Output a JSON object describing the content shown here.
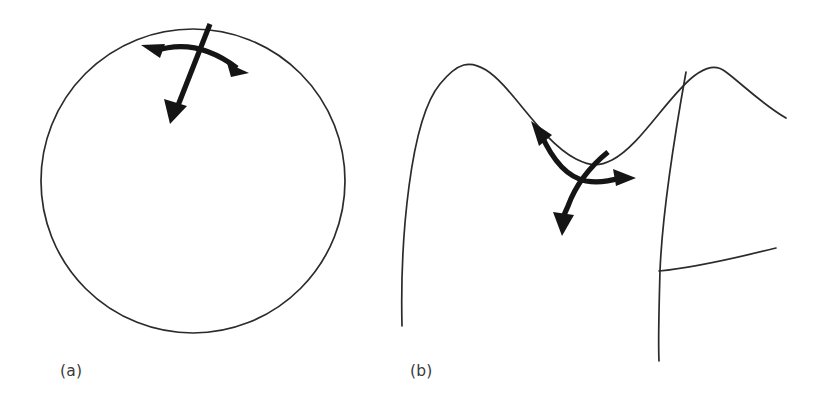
{
  "figure": {
    "title": "",
    "background_color": "#ffffff",
    "width": 827,
    "height": 415,
    "curve_color": "#2b2b2b",
    "arrow_color": "#151515",
    "label_color": "#3a3a3a"
  },
  "panels": [
    {
      "id": "a",
      "label": "(a)",
      "label_position": {
        "x": 60,
        "y": 362
      },
      "description": "circle-with-tangent-and-normal-arrows",
      "shapes": {
        "circle": {
          "cx": 193,
          "cy": 181,
          "r": 152
        },
        "tangent_double_arrow": {
          "type": "double-headed",
          "head_1": {
            "x": 143,
            "y": 46
          },
          "head_2": {
            "x": 247,
            "y": 72
          },
          "control": {
            "x": 196,
            "y": 38
          }
        },
        "normal_arrow": {
          "type": "single-headed",
          "tail": {
            "x": 210,
            "y": 24
          },
          "head": {
            "x": 170,
            "y": 122
          }
        }
      }
    },
    {
      "id": "b",
      "label": "(b)",
      "label_position": {
        "x": 410,
        "y": 362
      },
      "description": "wavy-surface-with-tangent-and-normal-arrows",
      "shapes": {
        "wave_curve": {
          "left_tail": {
            "x": 402,
            "y": 326
          },
          "peak_1": {
            "x": 476,
            "y": 62
          },
          "valley": {
            "x": 606,
            "y": 164
          },
          "peak_2": {
            "x": 720,
            "y": 66
          },
          "right_tail": {
            "x": 786,
            "y": 118
          }
        },
        "vertical_curve": {
          "top": {
            "x": 686,
            "y": 72
          },
          "bottom": {
            "x": 659,
            "y": 361
          }
        },
        "horizontal_curve": {
          "left": {
            "x": 659,
            "y": 271
          },
          "right": {
            "x": 776,
            "y": 248
          }
        },
        "tangent_double_arrow": {
          "type": "double-headed",
          "head_1": {
            "x": 533,
            "y": 124
          },
          "head_2": {
            "x": 632,
            "y": 178
          },
          "control": {
            "x": 556,
            "y": 170
          }
        },
        "normal_arrow": {
          "type": "single-headed",
          "tail": {
            "x": 608,
            "y": 152
          },
          "head": {
            "x": 562,
            "y": 233
          }
        }
      }
    }
  ],
  "legend": {
    "present": false,
    "entries": []
  },
  "chart_data": {
    "type": "line",
    "title": "",
    "xlabel": "",
    "ylabel": "",
    "grid": false,
    "legend_position": "none",
    "annotations": [
      "(a)",
      "(b)"
    ],
    "series": [
      {
        "name": "panel-a-circle",
        "kind": "circle",
        "center": [
          193,
          181
        ],
        "radius": 152
      },
      {
        "name": "panel-b-wave",
        "kind": "wave",
        "x": [
          402,
          476,
          606,
          720,
          786
        ],
        "y": [
          326,
          62,
          164,
          66,
          118
        ]
      },
      {
        "name": "panel-b-vertical-fold",
        "kind": "line",
        "x": [
          686,
          659
        ],
        "y": [
          72,
          361
        ]
      },
      {
        "name": "panel-b-horizontal-fold",
        "kind": "line",
        "x": [
          659,
          776
        ],
        "y": [
          271,
          248
        ]
      }
    ]
  }
}
